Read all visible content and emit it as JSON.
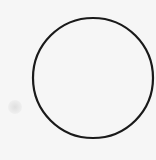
{
  "shape": {
    "type": "circle",
    "cx": 93,
    "cy": 78,
    "r": 60,
    "stroke": "#1a1a1a",
    "stroke_width": 2.2,
    "fill": "none"
  },
  "background": "#f6f6f6"
}
